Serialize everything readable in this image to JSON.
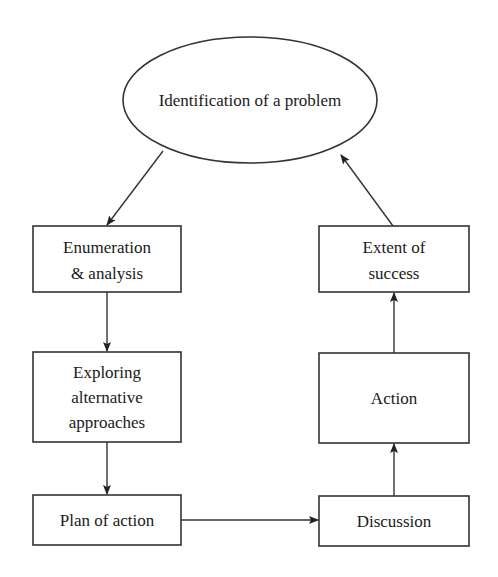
{
  "diagram": {
    "type": "cycle-flowchart",
    "nodes": [
      {
        "id": "identification",
        "shape": "ellipse",
        "lines": [
          "Identification of a problem"
        ]
      },
      {
        "id": "enumeration",
        "shape": "rect",
        "lines": [
          "Enumeration",
          "& analysis"
        ]
      },
      {
        "id": "exploring",
        "shape": "rect",
        "lines": [
          "Exploring",
          "alternative",
          "approaches"
        ]
      },
      {
        "id": "plan",
        "shape": "rect",
        "lines": [
          "Plan of action"
        ]
      },
      {
        "id": "discussion",
        "shape": "rect",
        "lines": [
          "Discussion"
        ]
      },
      {
        "id": "action",
        "shape": "rect",
        "lines": [
          "Action"
        ]
      },
      {
        "id": "extent",
        "shape": "rect",
        "lines": [
          "Extent of",
          "success"
        ]
      }
    ],
    "edges": [
      {
        "from": "identification",
        "to": "enumeration"
      },
      {
        "from": "enumeration",
        "to": "exploring"
      },
      {
        "from": "exploring",
        "to": "plan"
      },
      {
        "from": "plan",
        "to": "discussion"
      },
      {
        "from": "discussion",
        "to": "action"
      },
      {
        "from": "action",
        "to": "extent"
      },
      {
        "from": "extent",
        "to": "identification"
      }
    ],
    "colors": {
      "stroke": "#333333",
      "text": "#1a1a1a",
      "background": "#ffffff"
    }
  }
}
